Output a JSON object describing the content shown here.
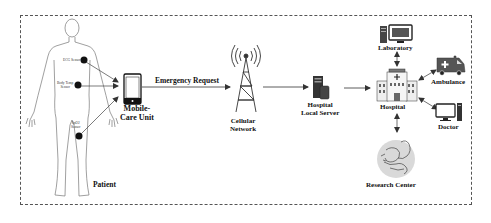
{
  "diagram": {
    "type": "flow",
    "nodes": {
      "patient": {
        "label": "Patient"
      },
      "ecg_sensor": {
        "label": "ECG Sensor"
      },
      "body_temp_sensor": {
        "label": "Body Temp\nSensor"
      },
      "spo2_sensor": {
        "label": "SpO2\nSensor"
      },
      "mobile_care_unit": {
        "label": "Mobile-\nCare Unit"
      },
      "cellular_network": {
        "label": "Cellular\nNetwork"
      },
      "hospital_local_server": {
        "label": "Hospital\nLocal Server"
      },
      "hospital": {
        "label": "Hospital"
      },
      "laboratory": {
        "label": "Laboratory"
      },
      "ambulance": {
        "label": "Ambulance"
      },
      "doctor": {
        "label": "Doctor"
      },
      "research_center": {
        "label": "Research Center"
      }
    },
    "edges": [
      {
        "from": "ecg_sensor",
        "to": "mobile_care_unit",
        "direction": "one-way"
      },
      {
        "from": "body_temp_sensor",
        "to": "mobile_care_unit",
        "direction": "one-way"
      },
      {
        "from": "spo2_sensor",
        "to": "mobile_care_unit",
        "direction": "one-way"
      },
      {
        "from": "mobile_care_unit",
        "to": "cellular_network",
        "label": "Emergency Request",
        "direction": "one-way"
      },
      {
        "from": "cellular_network",
        "to": "hospital_local_server",
        "direction": "one-way"
      },
      {
        "from": "hospital_local_server",
        "to": "hospital",
        "direction": "one-way"
      },
      {
        "from": "hospital",
        "to": "laboratory",
        "direction": "two-way"
      },
      {
        "from": "hospital",
        "to": "ambulance",
        "direction": "two-way"
      },
      {
        "from": "hospital",
        "to": "doctor",
        "direction": "two-way"
      },
      {
        "from": "hospital",
        "to": "research_center",
        "direction": "two-way"
      }
    ],
    "edge_labels": {
      "emergency_request": "Emergency Request"
    }
  }
}
